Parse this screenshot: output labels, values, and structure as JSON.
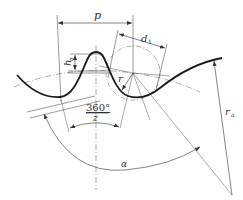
{
  "diagram": {
    "type": "sprocket tooth profile geometry",
    "labels": {
      "pitch": "p",
      "roller_diameter": "d",
      "roller_diameter_sub": "1",
      "tooth_height": "h",
      "tooth_height_sub": "a",
      "seating_radius": "r",
      "pitch_angle_num": "360°",
      "pitch_angle_den": "z",
      "angle": "α",
      "outer_radius": "r",
      "outer_radius_sub": "a"
    },
    "colors": {
      "profile": "#1a1a1a",
      "thin_line": "#555555",
      "background": "#ffffff"
    }
  }
}
